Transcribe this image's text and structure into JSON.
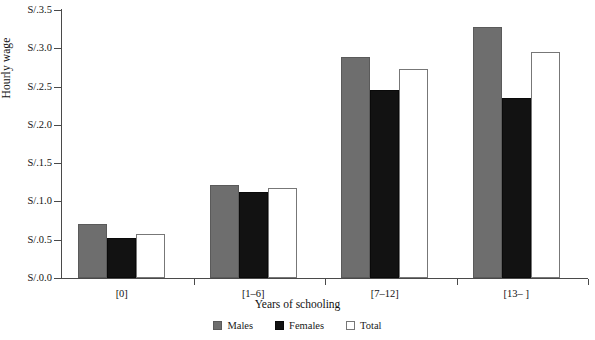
{
  "chart_data": {
    "type": "bar",
    "title": "",
    "xlabel": "Years of schooling",
    "ylabel": "Hourly wage",
    "categories": [
      "[0]",
      "[1–6]",
      "[7–12]",
      "[13– ]"
    ],
    "series": [
      {
        "name": "Males",
        "values": [
          0.71,
          1.21,
          2.88,
          3.28
        ]
      },
      {
        "name": "Females",
        "values": [
          0.52,
          1.12,
          2.45,
          2.35
        ]
      },
      {
        "name": "Total",
        "values": [
          0.57,
          1.17,
          2.73,
          2.95
        ]
      }
    ],
    "ylim": [
      0,
      3.5
    ],
    "ytick_values": [
      0.0,
      0.5,
      1.0,
      1.5,
      2.0,
      2.5,
      3.0,
      3.5
    ],
    "ytick_labels": [
      "S/.0.0",
      "S/.0.5",
      "S/.1.0",
      "S/.1.5",
      "S/.2.0",
      "S/.2.5",
      "S/.3.0",
      "S/.3.5"
    ],
    "grid": false,
    "legend_position": "bottom-center",
    "colors": {
      "males": "#6e6e6e",
      "females": "#121212",
      "total": "#ffffff",
      "axis": "#4a4a4a",
      "text": "#111111",
      "background": "#ffffff"
    }
  },
  "legend": {
    "items": [
      {
        "label": "Males",
        "key": "males"
      },
      {
        "label": "Females",
        "key": "females"
      },
      {
        "label": "Total",
        "key": "total"
      }
    ]
  }
}
